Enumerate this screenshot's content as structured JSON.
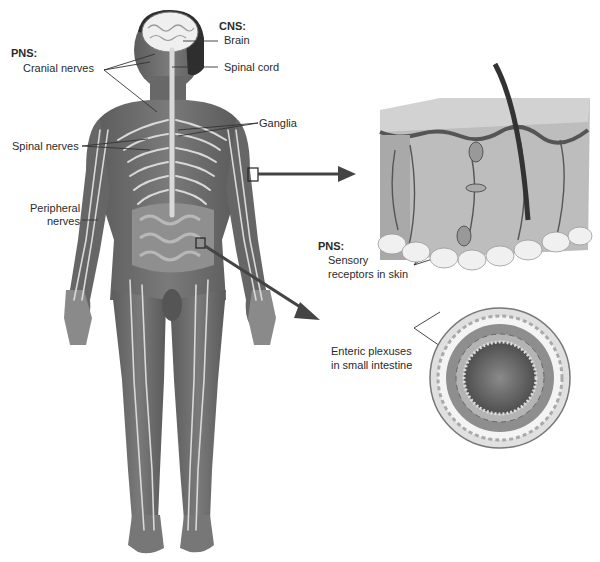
{
  "diagram": {
    "title_hidden": "Nervous system overview",
    "labels": {
      "cns_header": "CNS:",
      "brain": "Brain",
      "spinal_cord": "Spinal cord",
      "pns_header_body": "PNS:",
      "cranial_nerves": "Cranial nerves",
      "ganglia": "Ganglia",
      "spinal_nerves": "Spinal nerves",
      "peripheral_nerves_line1": "Peripheral",
      "peripheral_nerves_line2": "nerves",
      "pns_header_skin": "PNS:",
      "sensory_line1": "Sensory",
      "sensory_line2": "receptors in skin",
      "enteric_line1": "Enteric plexuses",
      "enteric_line2": "in small intestine"
    },
    "insets": [
      {
        "name": "skin-cross-section",
        "source": "arm box"
      },
      {
        "name": "small-intestine-cross-section",
        "source": "intestine box"
      }
    ],
    "colors": {
      "body": "#6e6e6e",
      "body_dark": "#555555",
      "nerve": "#d8d8d8",
      "brain": "#eeeeee",
      "leader": "#333333",
      "arrow": "#444444",
      "skin_top": "#cfcfcf",
      "fat": "#f2f2f2"
    }
  }
}
